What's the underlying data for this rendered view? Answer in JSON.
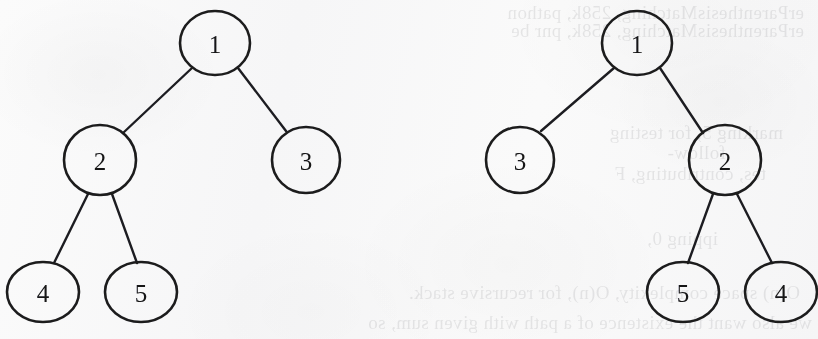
{
  "figure": {
    "kind": "binary-tree-pair",
    "background_color": "#f8f8f9",
    "ink_color": "#1c1c1e"
  },
  "trees": [
    {
      "id": "original-tree",
      "name": "left-binary-tree",
      "nodes": [
        {
          "id": "L1",
          "label": "1",
          "cx": 215,
          "cy": 43,
          "rx": 35,
          "ry": 32
        },
        {
          "id": "L2",
          "label": "2",
          "cx": 100,
          "cy": 160,
          "rx": 36,
          "ry": 35
        },
        {
          "id": "L3",
          "label": "3",
          "cx": 306,
          "cy": 160,
          "rx": 34,
          "ry": 33
        },
        {
          "id": "L4",
          "label": "4",
          "cx": 43,
          "cy": 292,
          "rx": 36,
          "ry": 30
        },
        {
          "id": "L5",
          "label": "5",
          "cx": 141,
          "cy": 292,
          "rx": 36,
          "ry": 30
        }
      ],
      "edges": [
        {
          "from": "L1",
          "to": "L2",
          "x1": 192,
          "y1": 68,
          "x2": 123,
          "y2": 133
        },
        {
          "from": "L1",
          "to": "L3",
          "x1": 238,
          "y1": 68,
          "x2": 286,
          "y2": 131
        },
        {
          "from": "L2",
          "to": "L4",
          "x1": 88,
          "y1": 194,
          "x2": 54,
          "y2": 263
        },
        {
          "from": "L2",
          "to": "L5",
          "x1": 112,
          "y1": 194,
          "x2": 137,
          "y2": 263
        }
      ]
    },
    {
      "id": "mirror-tree",
      "name": "right-binary-tree",
      "nodes": [
        {
          "id": "R1",
          "label": "1",
          "cx": 637,
          "cy": 43,
          "rx": 35,
          "ry": 32
        },
        {
          "id": "R3",
          "label": "3",
          "cx": 520,
          "cy": 160,
          "rx": 34,
          "ry": 33
        },
        {
          "id": "R2",
          "label": "2",
          "cx": 725,
          "cy": 160,
          "rx": 36,
          "ry": 35
        },
        {
          "id": "R5",
          "label": "5",
          "cx": 683,
          "cy": 292,
          "rx": 36,
          "ry": 30
        },
        {
          "id": "R4",
          "label": "4",
          "cx": 781,
          "cy": 292,
          "rx": 36,
          "ry": 30
        }
      ],
      "edges": [
        {
          "from": "R1",
          "to": "R3",
          "x1": 614,
          "y1": 68,
          "x2": 541,
          "y2": 131
        },
        {
          "from": "R1",
          "to": "R2",
          "x1": 660,
          "y1": 68,
          "x2": 703,
          "y2": 133
        },
        {
          "from": "R2",
          "to": "R5",
          "x1": 713,
          "y1": 194,
          "x2": 688,
          "y2": 263
        },
        {
          "from": "R2",
          "to": "R4",
          "x1": 737,
          "y1": 194,
          "x2": 772,
          "y2": 263
        }
      ]
    }
  ],
  "showthrough_text": [
    {
      "text": "erParenthesisMatching, 258k, pathon",
      "x": 14,
      "y": 2
    },
    {
      "text": "erParenthesisMatching, 258k, pnr be",
      "x": 14,
      "y": 20
    },
    {
      "text": "marking 5, for testing",
      "x": 35,
      "y": 122
    },
    {
      "text": "follow-",
      "x": 92,
      "y": 142
    },
    {
      "text": "tes, contributing, F",
      "x": 52,
      "y": 163
    },
    {
      "text": "ipping 0,",
      "x": 100,
      "y": 228
    },
    {
      "text": "O(n) space complexity, O(n), for recursive stack.",
      "x": 18,
      "y": 282
    },
    {
      "text": "we also want the existence of a path with given sum, so",
      "x": 6,
      "y": 312
    }
  ]
}
